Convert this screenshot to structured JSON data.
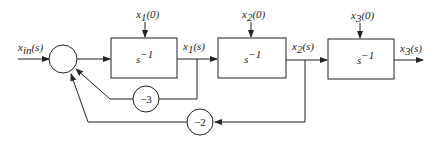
{
  "diagram": {
    "input_label": "x_in(s)",
    "input_label_main": "x",
    "input_label_sub": "in",
    "input_label_tail": "(s)",
    "blocks": [
      {
        "id": "int1",
        "label": "s",
        "exp": "−1",
        "ic_main": "x",
        "ic_sub": "1",
        "ic_tail": "(0)",
        "out_main": "x",
        "out_sub": "1",
        "out_tail": "(s)"
      },
      {
        "id": "int2",
        "label": "s",
        "exp": "−1",
        "ic_main": "x",
        "ic_sub": "2",
        "ic_tail": "(0)",
        "out_main": "x",
        "out_sub": "2",
        "out_tail": "(s)"
      },
      {
        "id": "int3",
        "label": "s",
        "exp": "−1",
        "ic_main": "x",
        "ic_sub": "3",
        "ic_tail": "(0)",
        "out_main": "x",
        "out_sub": "3",
        "out_tail": "(s)"
      }
    ],
    "gains": [
      {
        "id": "g1",
        "value": "−3"
      },
      {
        "id": "g2",
        "value": "−2"
      }
    ],
    "colors": {
      "stroke": "#222222",
      "background": "#ffffff"
    }
  }
}
